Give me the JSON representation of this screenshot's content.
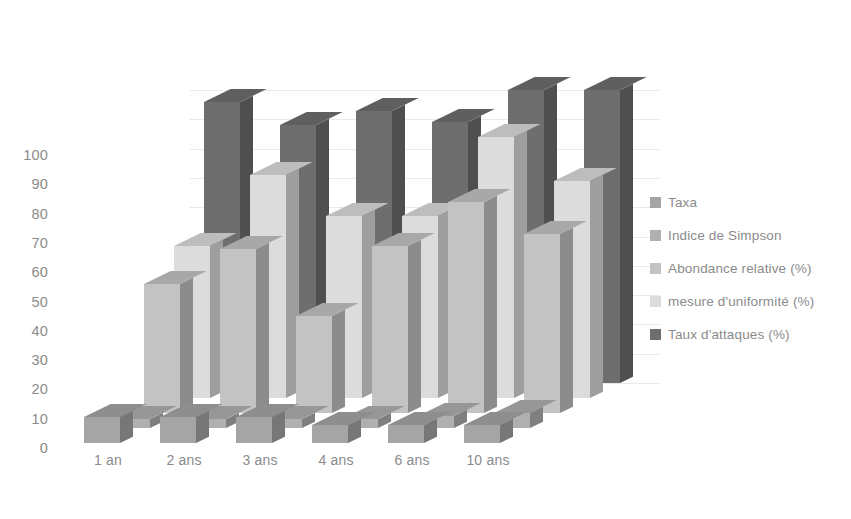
{
  "chart_data": {
    "type": "bar",
    "subtype": "3d-clustered-column",
    "title": "",
    "xlabel": "",
    "ylabel": "",
    "ylim": [
      0,
      100
    ],
    "y_ticks": [
      0,
      10,
      20,
      30,
      40,
      50,
      60,
      70,
      80,
      90,
      100
    ],
    "grid": true,
    "legend_position": "right",
    "categories": [
      "1 an",
      "2 ans",
      "3 ans",
      "4 ans",
      "6 ans",
      "10 ans"
    ],
    "series": [
      {
        "name": "Taxa",
        "color": "#a5a5a5",
        "values": [
          9,
          9,
          9,
          6,
          6,
          6
        ]
      },
      {
        "name": "Indice de Simpson",
        "color": "#b0b0b0",
        "values": [
          3,
          3,
          3,
          3,
          4,
          5
        ]
      },
      {
        "name": "Abondance relative (%)",
        "color": "#c3c3c3",
        "values": [
          44,
          56,
          33,
          57,
          72,
          61
        ]
      },
      {
        "name": "mesure d'uniformité (%)",
        "color": "#dcdcdc",
        "values": [
          52,
          76,
          62,
          62,
          89,
          74
        ]
      },
      {
        "name": "Taux d'attaques (%)",
        "color": "#6e6e6e",
        "values": [
          96,
          88,
          93,
          89,
          100,
          100
        ]
      }
    ]
  },
  "axis": {
    "y_labels": [
      "100",
      "90",
      "80",
      "70",
      "60",
      "50",
      "40",
      "30",
      "20",
      "10",
      "0"
    ],
    "x_labels": [
      "1 an",
      "2 ans",
      "3 ans",
      "4 ans",
      "6 ans",
      "10 ans"
    ]
  },
  "legend": {
    "items": [
      {
        "label": "Taxa",
        "color": "#a5a5a5"
      },
      {
        "label": "Indice de Simpson",
        "color": "#b0b0b0"
      },
      {
        "label": "Abondance relative (%)",
        "color": "#c3c3c3"
      },
      {
        "label": "mesure d'uniformité (%)",
        "color": "#dcdcdc"
      },
      {
        "label": "Taux d'attaques (%)",
        "color": "#6e6e6e"
      }
    ]
  },
  "colors": {
    "background": "#ffffff",
    "gridline": "#e9e9e9",
    "text": "#8b8b8b"
  }
}
